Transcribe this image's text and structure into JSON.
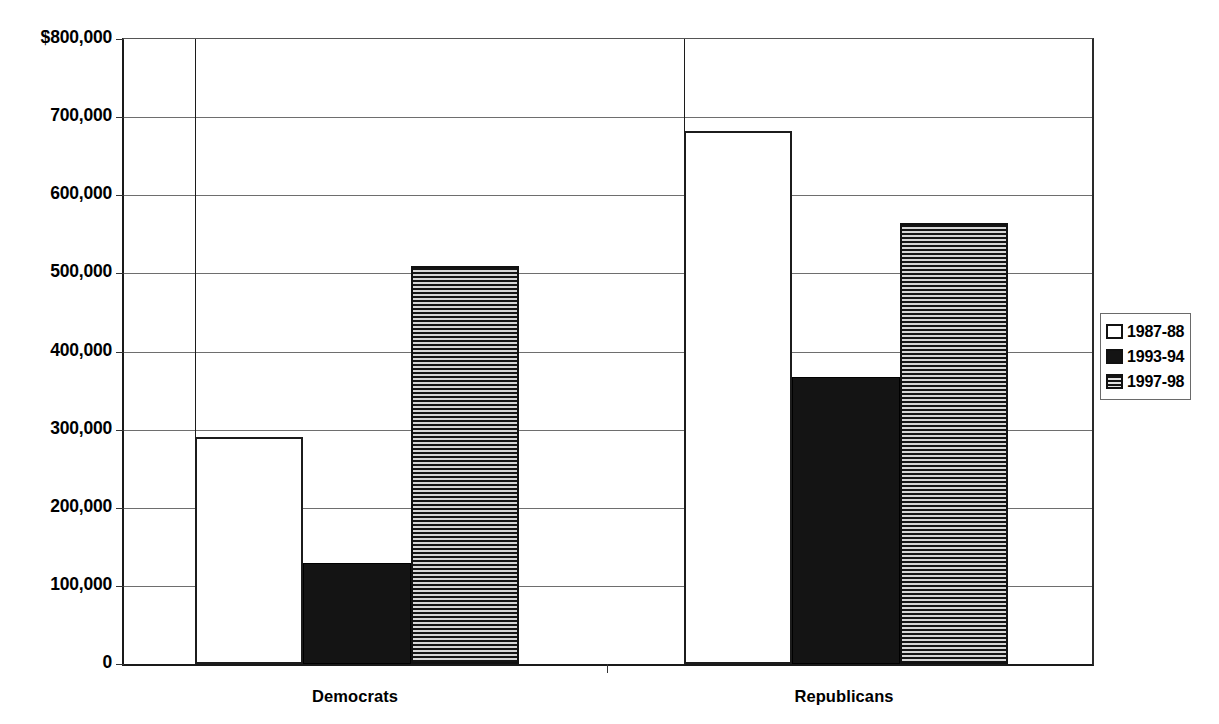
{
  "chart_data": {
    "type": "bar",
    "title": "",
    "xlabel": "",
    "ylabel": "",
    "categories": [
      "Democrats",
      "Republicans"
    ],
    "series": [
      {
        "name": "1987-88",
        "style": "open",
        "values": [
          291000,
          682000
        ]
      },
      {
        "name": "1993-94",
        "style": "solid",
        "values": [
          129000,
          368000
        ]
      },
      {
        "name": "1997-98",
        "style": "hatch",
        "values": [
          509000,
          564000
        ]
      }
    ],
    "ylim": [
      0,
      800000
    ],
    "y_tick_values": [
      800000,
      700000,
      600000,
      500000,
      400000,
      300000,
      200000,
      100000,
      0
    ],
    "y_tick_labels": [
      "$800,000",
      "700,000",
      "600,000",
      "500,000",
      "400,000",
      "300,000",
      "200,000",
      "100,000",
      "0"
    ],
    "grid": true,
    "legend_position": "right",
    "legend_entries": [
      "1987-88",
      "1993-94",
      "1997-98"
    ]
  },
  "axis": {
    "y_labels": [
      "$800,000",
      "700,000",
      "600,000",
      "500,000",
      "400,000",
      "300,000",
      "200,000",
      "100,000",
      "0"
    ],
    "x_labels": [
      "Democrats",
      "Republicans"
    ]
  },
  "legend": {
    "items": [
      {
        "label": "1987-88",
        "style": "open"
      },
      {
        "label": "1993-94",
        "style": "solid"
      },
      {
        "label": "1997-98",
        "style": "hatch"
      }
    ]
  },
  "colors": {
    "axis": "#1a1a1a",
    "gridline": "#6e6e6e",
    "bar_solid": "#141414",
    "bar_open": "#ffffff",
    "bar_hatch_dark": "#141414",
    "bar_hatch_light": "#d6d6d6",
    "background": "#ffffff"
  }
}
